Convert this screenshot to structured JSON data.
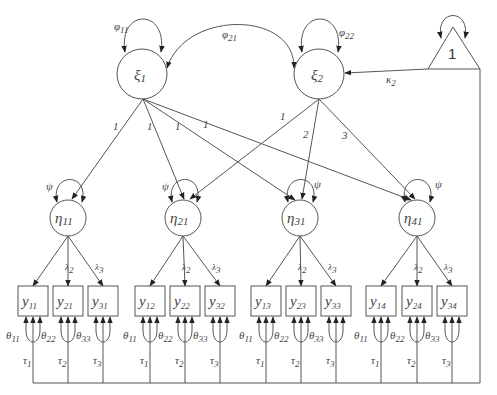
{
  "diagram": {
    "type": "structural equation model path diagram",
    "latent_factors": [
      {
        "id": "xi1",
        "label": "ξ",
        "sub": "1",
        "variance_label": "φ",
        "variance_sub": "11"
      },
      {
        "id": "xi2",
        "label": "ξ",
        "sub": "2",
        "variance_label": "φ",
        "variance_sub": "22"
      }
    ],
    "covariance": {
      "label": "φ",
      "sub": "21"
    },
    "constant": {
      "label": "1",
      "path_label": "κ",
      "path_sub": "2"
    },
    "first_order": [
      {
        "label": "η",
        "sub": "11",
        "var": "ψ",
        "loading_xi1": "1",
        "loading_xi2": ""
      },
      {
        "label": "η",
        "sub": "21",
        "var": "ψ",
        "loading_xi1": "1",
        "loading_xi2": "1"
      },
      {
        "label": "η",
        "sub": "31",
        "var": "ψ",
        "loading_xi1": "1",
        "loading_xi2": "2"
      },
      {
        "label": "η",
        "sub": "41",
        "var": "ψ",
        "loading_xi1": "1",
        "loading_xi2": "3"
      }
    ],
    "indicator_loadings": [
      {
        "label": "λ",
        "sub": "2"
      },
      {
        "label": "λ",
        "sub": "3"
      }
    ],
    "indicators": [
      [
        {
          "l": "y",
          "s": "11"
        },
        {
          "l": "y",
          "s": "21"
        },
        {
          "l": "y",
          "s": "31"
        }
      ],
      [
        {
          "l": "y",
          "s": "12"
        },
        {
          "l": "y",
          "s": "22"
        },
        {
          "l": "y",
          "s": "32"
        }
      ],
      [
        {
          "l": "y",
          "s": "13"
        },
        {
          "l": "y",
          "s": "23"
        },
        {
          "l": "y",
          "s": "33"
        }
      ],
      [
        {
          "l": "y",
          "s": "14"
        },
        {
          "l": "y",
          "s": "24"
        },
        {
          "l": "y",
          "s": "34"
        }
      ]
    ],
    "residuals": [
      {
        "l": "θ",
        "s": "11"
      },
      {
        "l": "θ",
        "s": "22"
      },
      {
        "l": "θ",
        "s": "33"
      }
    ],
    "intercepts": [
      {
        "l": "τ",
        "s": "1"
      },
      {
        "l": "τ",
        "s": "2"
      },
      {
        "l": "τ",
        "s": "3"
      }
    ]
  }
}
